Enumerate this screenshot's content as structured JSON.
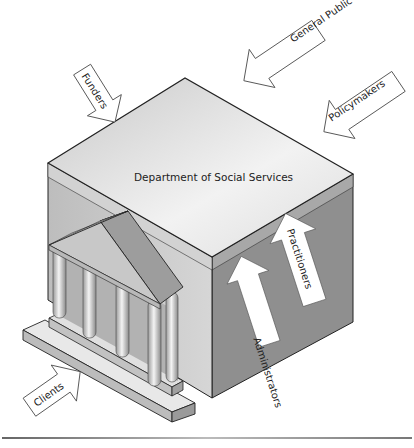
{
  "diagram": {
    "building_label": "Department of Social Services",
    "external_stakeholders": [
      {
        "label": "Funders",
        "direction": "inward"
      },
      {
        "label": "General Public",
        "direction": "inward"
      },
      {
        "label": "Policymakers",
        "direction": "inward"
      },
      {
        "label": "Clients",
        "direction": "inward"
      }
    ],
    "internal_stakeholders": [
      {
        "label": "Administrators",
        "direction": "upward"
      },
      {
        "label": "Practitioners",
        "direction": "upward"
      }
    ]
  },
  "colors": {
    "roof_top": "#e6e6e6",
    "left_wall": "#c4c4c4",
    "right_wall": "#8e8e8e",
    "outline": "#222222",
    "arrow_fill": "#ffffff"
  }
}
